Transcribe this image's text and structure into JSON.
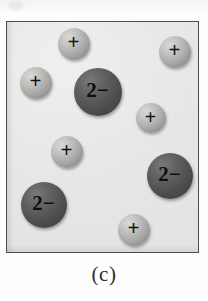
{
  "figure": {
    "caption": "(c)",
    "panel": {
      "border_color": "#4c4c4c",
      "background_color": "#e9e9e7",
      "x": 6,
      "y": 21,
      "width": 193,
      "height": 232
    },
    "legend": {
      "cation_label": "+",
      "anion_label": "2−",
      "cation_color": "#a8a8a6",
      "anion_color": "#515154"
    },
    "particles": [
      {
        "id": "cation-1",
        "charge": "+",
        "type": "cation",
        "cx": 74,
        "cy": 44,
        "r": 16,
        "font_size": 21
      },
      {
        "id": "cation-2",
        "charge": "+",
        "type": "cation",
        "cx": 175,
        "cy": 52,
        "r": 16,
        "font_size": 21
      },
      {
        "id": "cation-3",
        "charge": "+",
        "type": "cation",
        "cx": 36,
        "cy": 83,
        "r": 16,
        "font_size": 21
      },
      {
        "id": "anion-1",
        "charge": "2−",
        "type": "anion",
        "cx": 98,
        "cy": 92,
        "r": 24,
        "font_size": 21
      },
      {
        "id": "cation-4",
        "charge": "+",
        "type": "cation",
        "cx": 151,
        "cy": 118,
        "r": 15,
        "font_size": 20
      },
      {
        "id": "cation-5",
        "charge": "+",
        "type": "cation",
        "cx": 67,
        "cy": 152,
        "r": 16,
        "font_size": 21
      },
      {
        "id": "anion-2",
        "charge": "2−",
        "type": "anion",
        "cx": 170,
        "cy": 176,
        "r": 23,
        "font_size": 21
      },
      {
        "id": "anion-3",
        "charge": "2−",
        "type": "anion",
        "cx": 44,
        "cy": 205,
        "r": 23,
        "font_size": 21
      },
      {
        "id": "cation-6",
        "charge": "+",
        "type": "cation",
        "cx": 134,
        "cy": 230,
        "r": 16,
        "font_size": 21
      }
    ]
  }
}
